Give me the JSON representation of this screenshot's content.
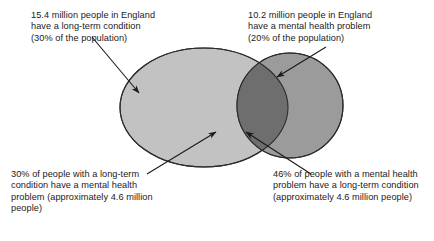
{
  "diagram": {
    "type": "venn",
    "colors": {
      "left_circle_fill": "#c2c2c2",
      "right_circle_fill": "#9b9b9b",
      "overlap_fill": "#6e6e6e",
      "outline": "#2b2b2b",
      "arrow": "#1a1a1a",
      "text": "#1a1a1a",
      "background": "#ffffff"
    },
    "sets": [
      {
        "name": "long-term-condition",
        "position": "left",
        "value_millions": 15.4,
        "percent_of_population": 30
      },
      {
        "name": "mental-health-problem",
        "position": "right",
        "value_millions": 10.2,
        "percent_of_population": 20
      }
    ],
    "intersection": {
      "value_millions": 4.6,
      "percent_of_left_set": 30,
      "percent_of_right_set": 46
    }
  },
  "labels": {
    "top_left": "15.4 million people in England have a long-term condition (30% of the population)",
    "top_right": "10.2 million people in England have a mental health problem (20% of the population)",
    "bottom_left": "30% of people with a long-term condition have a mental health problem (approximately 4.6 million people)",
    "bottom_right": "46% of people with a mental health problem have a long-term condition (approximately 4.6 million people)"
  }
}
